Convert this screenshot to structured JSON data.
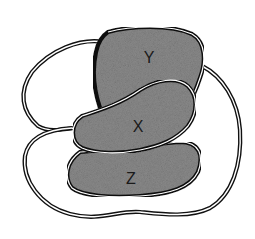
{
  "diagram": {
    "type": "overlapping-regions",
    "regions": [
      {
        "id": "Y",
        "label": "Y",
        "shaded": true
      },
      {
        "id": "X",
        "label": "X",
        "shaded": true
      },
      {
        "id": "Z",
        "label": "Z",
        "shaded": true
      }
    ],
    "outline_loops": [
      {
        "id": "upper-left-loop",
        "shaded": false
      },
      {
        "id": "outer-loop",
        "shaded": false
      }
    ],
    "colors": {
      "region_fill": "#8a8a8a",
      "outline": "#111111",
      "background": "#ffffff"
    }
  }
}
